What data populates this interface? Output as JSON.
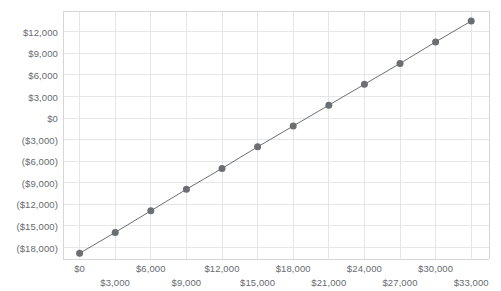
{
  "chart_data": {
    "type": "scatter",
    "title": "",
    "xlabel": "",
    "ylabel": "",
    "grid": true,
    "legend": false,
    "marker": {
      "shape": "circle",
      "color": "#6b6e73",
      "size": 7
    },
    "line": {
      "color": "#6b6e73",
      "width": 1
    },
    "xlim": [
      -1400,
      34500
    ],
    "ylim": [
      -19600,
      14900
    ],
    "x_tick_values": [
      0,
      3000,
      6000,
      9000,
      12000,
      15000,
      18000,
      21000,
      24000,
      27000,
      30000,
      33000
    ],
    "x_tick_labels": [
      "$0",
      "$3,000",
      "$6,000",
      "$9,000",
      "$12,000",
      "$15,000",
      "$18,000",
      "$21,000",
      "$24,000",
      "$27,000",
      "$30,000",
      "$33,000"
    ],
    "x_tick_rows": [
      0,
      1,
      0,
      1,
      0,
      1,
      0,
      1,
      0,
      1,
      0,
      1
    ],
    "y_tick_values": [
      12000,
      9000,
      6000,
      3000,
      0,
      -3000,
      -6000,
      -9000,
      -12000,
      -15000,
      -18000
    ],
    "y_tick_labels": [
      "$12,000",
      "$9,000",
      "$6,000",
      "$3,000",
      "$0",
      "($3,000)",
      "($6,000)",
      "($9,000)",
      "($12,000)",
      "($15,000)",
      "($18,000)"
    ],
    "x": [
      0,
      3000,
      6000,
      9000,
      12000,
      15000,
      18000,
      21000,
      24000,
      27000,
      30000,
      33000
    ],
    "y": [
      -18800,
      -15900,
      -12900,
      -9900,
      -7000,
      -4000,
      -1100,
      1800,
      4700,
      7600,
      10600,
      13500
    ],
    "points": [
      {
        "x": 0,
        "y": -18800
      },
      {
        "x": 3000,
        "y": -15900
      },
      {
        "x": 6000,
        "y": -12900
      },
      {
        "x": 9000,
        "y": -9900
      },
      {
        "x": 12000,
        "y": -7000
      },
      {
        "x": 15000,
        "y": -4000
      },
      {
        "x": 18000,
        "y": -1100
      },
      {
        "x": 21000,
        "y": 1800
      },
      {
        "x": 24000,
        "y": 4700
      },
      {
        "x": 27000,
        "y": 7600
      },
      {
        "x": 30000,
        "y": 10600
      },
      {
        "x": 33000,
        "y": 13500
      }
    ]
  },
  "colors": {
    "marker": "#6b6e73",
    "line": "#6b6e73",
    "grid": "#e4e6e8",
    "axis": "#d4d6d9",
    "tick_text": "#666a6f",
    "background": "#ffffff"
  }
}
